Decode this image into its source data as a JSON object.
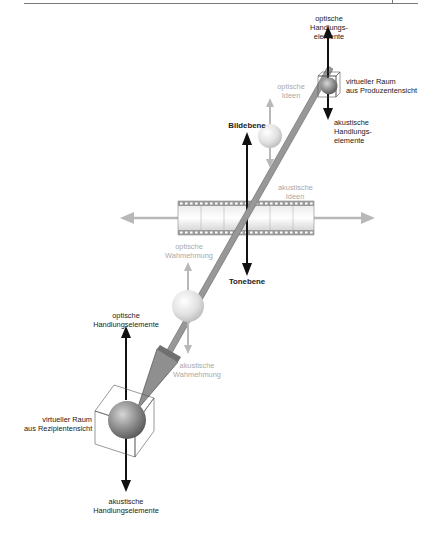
{
  "diagram": {
    "colors": {
      "black_arrow": "#111111",
      "grey_arrow": "#b5b5b5",
      "main_arrow_fill": "#9a9a9a",
      "main_arrow_edge": "#6a6a6a",
      "film_strip": "#cfcfcf",
      "film_edge": "#8a8a8a",
      "sphere_dark": "#7a7a7a",
      "sphere_light": "#e8e8e8",
      "header_rule": "#777777"
    },
    "labels": {
      "producer_top": {
        "line1": "optische",
        "line2": "Handlungs-",
        "line3": "elemente"
      },
      "producer_space": {
        "line1": "virtueller Raum",
        "line2": "aus Produzentensicht"
      },
      "producer_bottom": {
        "line1": "akustische",
        "line2": "Handlungs-",
        "line3": "elemente"
      },
      "ideas_top": {
        "line1": "optische",
        "line2": "Ideen"
      },
      "ideas_bottom": {
        "line1": "akustische",
        "line2": "Ideen"
      },
      "image_plane": "Bildebene",
      "sound_plane": "Tonebene",
      "perception_top": {
        "line1": "optische",
        "line2": "Wahmehmung"
      },
      "perception_bottom": {
        "line1": "akustische",
        "line2": "Wahmehmung"
      },
      "recipient_top": {
        "line1": "optische",
        "line2": "Handlungselemente"
      },
      "recipient_space": {
        "line1": "virtueller Raum",
        "line2": "aus Rezipientensicht"
      },
      "recipient_bottom": {
        "line1": "akustische",
        "line2": "Handlungselemente"
      }
    }
  }
}
